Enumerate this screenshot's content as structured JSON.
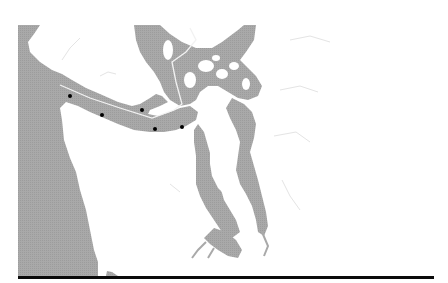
{
  "figure": {
    "title_partial": "",
    "title_note": "title text cut off at top edge; not legible"
  },
  "map": {
    "region": "Strait of Juan de Fuca and Puget Sound",
    "colors": {
      "water": "#a9a9a9",
      "land": "#ffffff",
      "rule": "#0a0a0a",
      "shipping_lane": "#f2f2f2",
      "marker": "#000000"
    },
    "markers": [
      {
        "id": 1,
        "x": 70,
        "y": 96
      },
      {
        "id": 2,
        "x": 102,
        "y": 115
      },
      {
        "id": 3,
        "x": 142,
        "y": 110
      },
      {
        "id": 4,
        "x": 155,
        "y": 129
      },
      {
        "id": 5,
        "x": 182,
        "y": 127
      }
    ]
  }
}
